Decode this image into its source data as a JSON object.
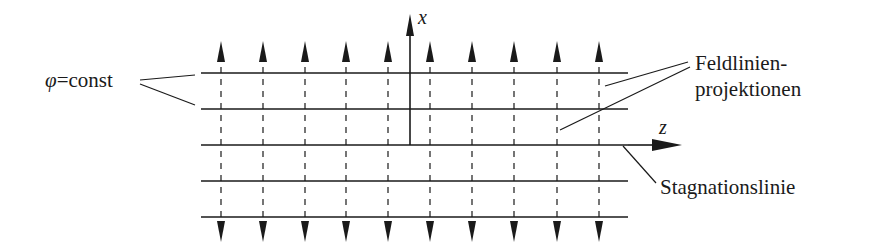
{
  "labels": {
    "phi_const": "=const",
    "phi_symbol": "φ",
    "x_axis": "x",
    "z_axis": "z",
    "feldlinien_line1": "Feldlinien-",
    "feldlinien_line2": "projektionen",
    "stagnation": "Stagnationslinie"
  },
  "geometry": {
    "horizontal_lines_y": [
      73,
      109,
      145,
      181,
      217
    ],
    "horizontal_x_start": 201,
    "horizontal_x_end": 628,
    "dashed_lines_x": [
      221,
      263,
      305,
      346,
      388,
      430,
      472,
      514,
      557,
      599
    ],
    "dashed_y_top": 73,
    "dashed_y_bottom": 217,
    "arrow_up_tip_y": 41,
    "arrow_down_tip_y": 242,
    "x_axis": {
      "x": 410,
      "y_top": 14,
      "y_bottom": 145
    },
    "z_axis": {
      "y": 145,
      "x_end": 682
    }
  },
  "colors": {
    "stroke": "#1a1a1a",
    "background": "#ffffff"
  }
}
